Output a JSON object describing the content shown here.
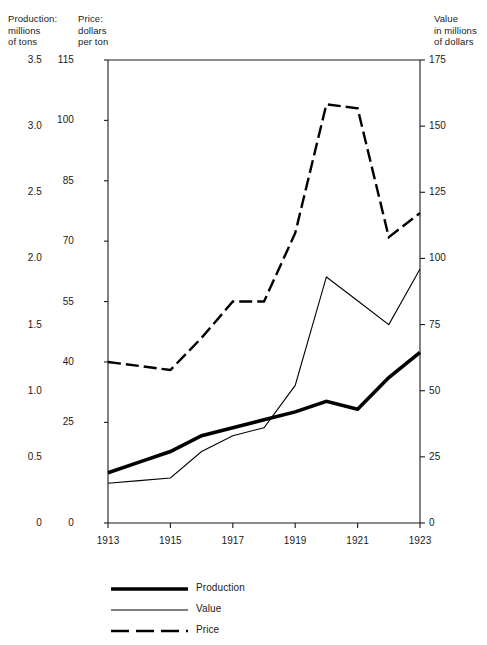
{
  "chart_data": {
    "type": "line",
    "title": "",
    "subtitle": "",
    "xlabel": "",
    "grid": false,
    "legend_position": "bottom-left",
    "x": [
      1913,
      1914,
      1915,
      1916,
      1917,
      1918,
      1919,
      1920,
      1921,
      1922,
      1923
    ],
    "x_tick_labels": [
      "1913",
      "1915",
      "1917",
      "1919",
      "1921",
      "1923"
    ],
    "x_ticks": [
      1913,
      1915,
      1917,
      1919,
      1921,
      1923
    ],
    "xlim": [
      1913,
      1923
    ],
    "axes": [
      {
        "id": "production",
        "side": "left",
        "caption": "Production:\nmillions\nof tons",
        "ylabel": "Production: millions of tons",
        "ylim": [
          0,
          3.5
        ],
        "ticks": [
          0,
          0.5,
          1.0,
          1.5,
          2.0,
          2.5,
          3.0,
          3.5
        ],
        "tick_labels": [
          "0",
          "0.5",
          "1.0",
          "1.5",
          "2.0",
          "2.5",
          "3.0",
          "3.5"
        ]
      },
      {
        "id": "price",
        "side": "left-inner",
        "caption": "Price:\ndollars\nper ton",
        "ylabel": "Price: dollars per ton",
        "ylim": [
          0,
          115
        ],
        "ticks": [
          0,
          25,
          40,
          55,
          70,
          85,
          100,
          115
        ],
        "tick_labels": [
          "0",
          "25",
          "40",
          "55",
          "70",
          "85",
          "100",
          "115"
        ]
      },
      {
        "id": "value",
        "side": "right",
        "caption": "Value\nin millions\nof dollars",
        "ylabel": "Value in millions of dollars",
        "ylim": [
          0,
          175
        ],
        "ticks": [
          0,
          25,
          50,
          75,
          100,
          125,
          150,
          175
        ],
        "tick_labels": [
          "0",
          "25",
          "50",
          "75",
          "100",
          "125",
          "150",
          "175"
        ]
      }
    ],
    "series": [
      {
        "name": "Production",
        "axis": "production",
        "style": "solid-thick",
        "color": "#000000",
        "width": 3.6,
        "units": "millions of tons",
        "values": [
          0.38,
          0.46,
          0.54,
          0.66,
          0.72,
          0.78,
          0.84,
          0.92,
          0.86,
          1.1,
          1.29
        ]
      },
      {
        "name": "Value",
        "axis": "value",
        "style": "solid-thin",
        "color": "#000000",
        "width": 1.1,
        "units": "millions of dollars",
        "values": [
          15,
          16,
          17,
          27,
          33,
          36,
          52,
          93,
          84,
          75,
          96
        ]
      },
      {
        "name": "Price",
        "axis": "price",
        "style": "dashed",
        "color": "#000000",
        "width": 2.4,
        "units": "dollars per ton",
        "values": [
          40,
          39,
          38,
          46,
          55,
          55,
          72,
          104,
          103,
          71,
          77
        ]
      }
    ],
    "legend": [
      {
        "label": "Production",
        "style": "solid-thick"
      },
      {
        "label": "Value",
        "style": "solid-thin"
      },
      {
        "label": "Price",
        "style": "dashed"
      }
    ]
  }
}
